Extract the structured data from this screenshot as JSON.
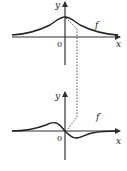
{
  "top_graph": {
    "y_label": "y",
    "x_label": "x",
    "origin_label": "0",
    "curve_label": "f"
  },
  "bottom_graph": {
    "y_label": "y",
    "x_label": "x",
    "origin_label": "0",
    "curve_label": "f′"
  },
  "colors": {
    "curve": "#222222",
    "axis": "#333333",
    "dashed": "#444444"
  }
}
